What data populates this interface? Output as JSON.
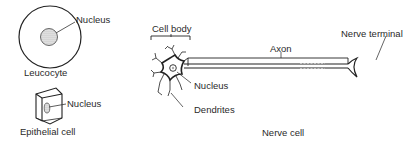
{
  "diagram": {
    "type": "cell-types-illustration",
    "stroke_color": "#222222",
    "nucleus_fill": "#bbbbbb",
    "cells": [
      {
        "name": "Leucocyte",
        "labels": {
          "caption": "Leucocyte",
          "nucleus": "Nucleus"
        }
      },
      {
        "name": "Epithelial cell",
        "labels": {
          "caption": "Epithelial cell",
          "nucleus": "Nucleus"
        }
      },
      {
        "name": "Nerve cell",
        "labels": {
          "caption": "Nerve cell",
          "cell_body": "Cell body",
          "nucleus": "Nucleus",
          "dendrites": "Dendrites",
          "axon": "Axon",
          "nerve_terminal": "Nerve terminal"
        }
      }
    ]
  }
}
